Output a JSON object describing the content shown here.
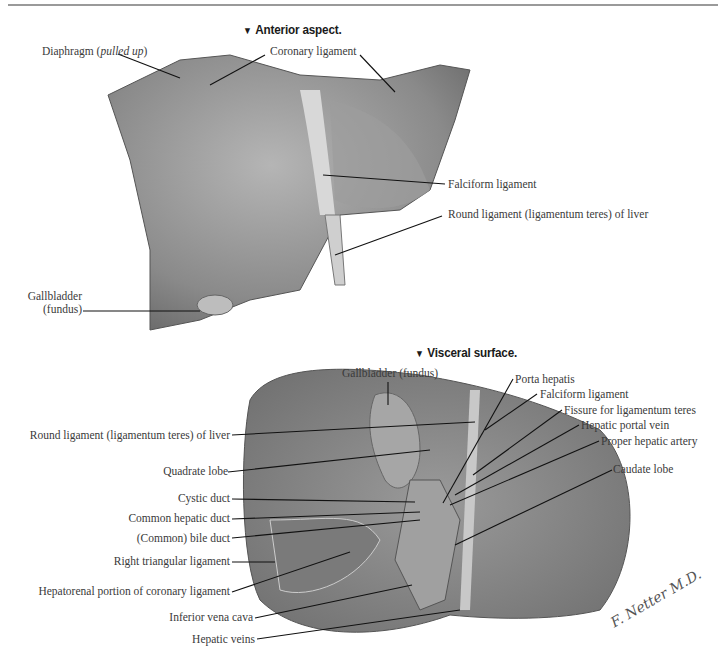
{
  "figure": {
    "sections": [
      {
        "heading": "Anterior aspect.",
        "labels": [
          {
            "id": "diaphragm",
            "text": "Diaphragm (",
            "italic": "pulled up",
            "suffix": ")"
          },
          {
            "id": "coronary-ligament",
            "text": "Coronary ligament"
          },
          {
            "id": "falciform-ligament",
            "text": "Falciform ligament"
          },
          {
            "id": "round-ligament",
            "text": "Round ligament (ligamentum teres) of liver"
          },
          {
            "id": "gallbladder-fundus-1",
            "text": "Gallbladder",
            "text2": "(fundus)"
          }
        ]
      },
      {
        "heading": "Visceral surface.",
        "labels": [
          {
            "id": "gallbladder-fundus-2",
            "text": "Gallbladder (fundus)"
          },
          {
            "id": "porta-hepatis",
            "text": "Porta hepatis"
          },
          {
            "id": "falciform-ligament-2",
            "text": "Falciform ligament"
          },
          {
            "id": "fissure-ligamentum-teres",
            "text": "Fissure for ligamentum teres"
          },
          {
            "id": "hepatic-portal-vein",
            "text": "Hepatic portal vein"
          },
          {
            "id": "proper-hepatic-artery",
            "text": "Proper hepatic artery"
          },
          {
            "id": "caudate-lobe",
            "text": "Caudate lobe"
          },
          {
            "id": "round-ligament-2",
            "text": "Round ligament (ligamentum teres) of liver"
          },
          {
            "id": "quadrate-lobe",
            "text": "Quadrate lobe"
          },
          {
            "id": "cystic-duct",
            "text": "Cystic duct"
          },
          {
            "id": "common-hepatic-duct",
            "text": "Common hepatic duct"
          },
          {
            "id": "common-bile-duct",
            "text": "(Common) bile duct"
          },
          {
            "id": "right-triangular-ligament",
            "text": "Right triangular ligament"
          },
          {
            "id": "hepatorenal-portion",
            "text": "Hepatorenal portion of coronary ligament"
          },
          {
            "id": "inferior-vena-cava",
            "text": "Inferior vena cava"
          },
          {
            "id": "hepatic-veins",
            "text": "Hepatic veins"
          }
        ]
      }
    ],
    "signature": "F. Netter M.D."
  }
}
